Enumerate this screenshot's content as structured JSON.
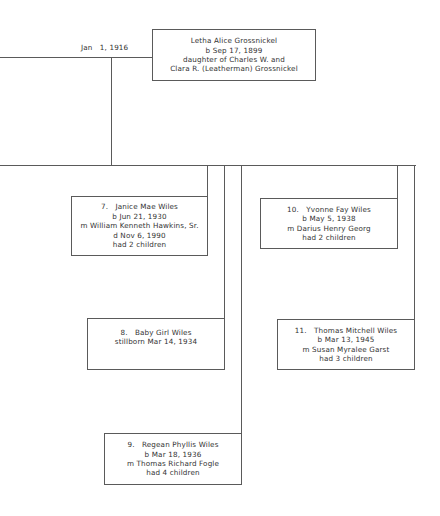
{
  "chart": {
    "marriage_date": "Jan   1, 1916",
    "spouse": {
      "lines": [
        "Letha Alice Grossnickel",
        "b Sep 17, 1899",
        "daughter of Charles W. and",
        "Clara R. (Leatherman) Grossnickel"
      ]
    },
    "children": [
      {
        "number": "7.",
        "lines": [
          "7.   Janice Mae Wiles",
          "b Jun 21, 1930",
          "m William Kenneth Hawkins, Sr.",
          "d Nov 6, 1990",
          "had 2 children"
        ]
      },
      {
        "number": "8.",
        "lines": [
          "8.   Baby Girl Wiles",
          "stillborn Mar 14, 1934"
        ]
      },
      {
        "number": "9.",
        "lines": [
          "9.   Regean Phyllis Wiles",
          "b Mar 18, 1936",
          "m Thomas Richard Fogle",
          "had 4 children"
        ]
      },
      {
        "number": "10.",
        "lines": [
          "10.   Yvonne Fay Wiles",
          "b May 5, 1938",
          "m Darius Henry Georg",
          "had 2 children"
        ]
      },
      {
        "number": "11.",
        "lines": [
          "11.   Thomas Mitchell Wiles",
          "b Mar 13, 1945",
          "m Susan Myralee Garst",
          "had 3 children"
        ]
      }
    ],
    "colors": {
      "line": "#5a5a5a",
      "text": "#333333",
      "background": "#ffffff"
    }
  }
}
